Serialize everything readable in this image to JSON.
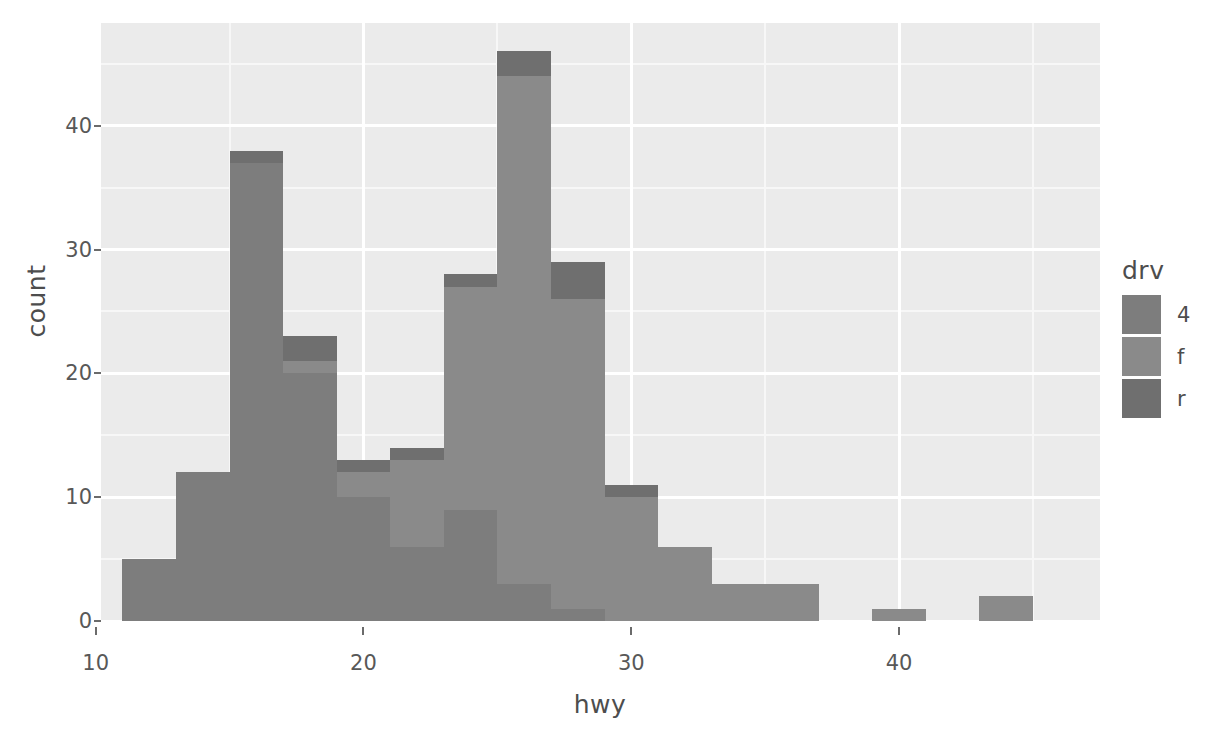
{
  "chart_data": {
    "type": "bar",
    "subtype": "stacked-histogram",
    "title": "",
    "xlabel": "hwy",
    "ylabel": "count",
    "xlim": [
      10.2,
      47.5
    ],
    "ylim": [
      0,
      48.3
    ],
    "binwidth": 2,
    "grid": true,
    "legend": {
      "position": "right",
      "title": "drv",
      "entries": [
        "4",
        "f",
        "r"
      ]
    },
    "x_ticks": [
      10,
      20,
      30,
      40
    ],
    "x_tick_labels": [
      "10",
      "20",
      "30",
      "40"
    ],
    "y_ticks": [
      0,
      10,
      20,
      30,
      40
    ],
    "y_tick_labels": [
      "0",
      "10",
      "20",
      "30",
      "40"
    ],
    "x_minor_ticks": [
      15,
      25,
      35,
      45
    ],
    "y_minor_ticks": [
      5,
      15,
      25,
      35,
      45
    ],
    "categories": [
      12,
      14,
      16,
      18,
      20,
      22,
      24,
      26,
      28,
      30,
      32,
      34,
      36,
      40,
      44
    ],
    "bin_starts": [
      11,
      13,
      15,
      17,
      19,
      21,
      23,
      25,
      27,
      29,
      31,
      33,
      35,
      39,
      43
    ],
    "bin_ends": [
      13,
      15,
      17,
      19,
      21,
      23,
      25,
      27,
      29,
      31,
      33,
      35,
      37,
      41,
      45
    ],
    "totals": [
      5,
      12,
      38,
      23,
      13,
      14,
      28,
      46,
      29,
      11,
      6,
      3,
      3,
      1,
      2
    ],
    "series": [
      {
        "name": "4",
        "label": "4",
        "color": "#7d7d7d",
        "values": [
          5,
          12,
          37,
          20,
          10,
          6,
          9,
          3,
          1,
          0,
          0,
          0,
          0,
          0,
          0
        ]
      },
      {
        "name": "f",
        "label": "f",
        "color": "#8a8a8a",
        "values": [
          0,
          0,
          0,
          1,
          2,
          7,
          18,
          41,
          25,
          10,
          6,
          3,
          3,
          1,
          2
        ]
      },
      {
        "name": "r",
        "label": "r",
        "color": "#6f6f6f",
        "values": [
          0,
          0,
          1,
          2,
          1,
          1,
          1,
          2,
          3,
          1,
          0,
          0,
          0,
          0,
          0
        ]
      }
    ]
  },
  "theme": {
    "panel_background": "#ebebeb",
    "grid_major_color": "#ffffff",
    "grid_minor_color": "#f7f7f7",
    "plot_background": "#ffffff",
    "axis_text_color": "#585858",
    "axis_title_color": "#4d4d4d",
    "bar_color": "#7f7f7f"
  }
}
